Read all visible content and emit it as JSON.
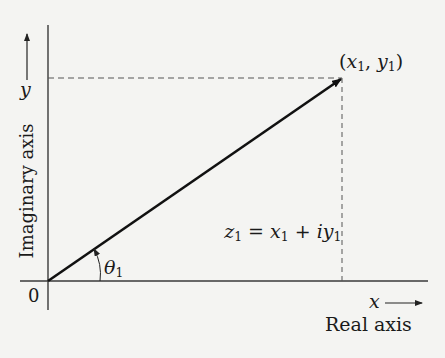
{
  "diagram": {
    "colors": {
      "background": "#f4f4f2",
      "ink": "#1a1a1a",
      "axis": "#3a3a3a",
      "dashed": "#555555"
    },
    "origin_label": "0",
    "x_axis": {
      "variable": "x",
      "name": "Real axis"
    },
    "y_axis": {
      "variable": "y",
      "name": "Imaginary axis"
    },
    "point": {
      "label_open": "(",
      "x": "x",
      "x_sub": "1",
      "sep": ", ",
      "y": "y",
      "y_sub": "1",
      "label_close": ")"
    },
    "vector": {
      "lhs": "z",
      "lhs_sub": "1",
      "eq": " = ",
      "x": "x",
      "x_sub": "1",
      "plus": " + ",
      "i": "i",
      "y": "y",
      "y_sub": "1"
    },
    "angle": {
      "symbol": "θ",
      "sub": "1"
    }
  }
}
